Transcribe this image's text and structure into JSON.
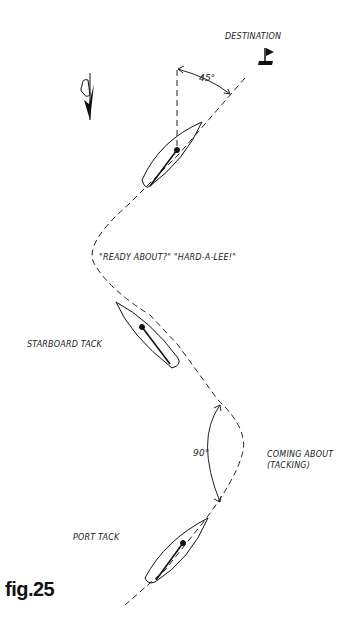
{
  "figure": {
    "label": "fig.25",
    "annotations": {
      "destination": "DESTINATION",
      "angle_45": "45°",
      "commands": "\"READY ABOUT?\" \"HARD-A-LEE!\"",
      "starboard_tack": "STARBOARD TACK",
      "angle_90": "90°",
      "coming_about_line1": "COMING ABOUT",
      "coming_about_line2": "(TACKING)",
      "port_tack": "PORT TACK"
    },
    "icons": [
      "wind-arrow-icon",
      "destination-flag-icon",
      "boat-icon"
    ],
    "colors": {
      "ink": "#111111",
      "background": "#ffffff"
    }
  }
}
